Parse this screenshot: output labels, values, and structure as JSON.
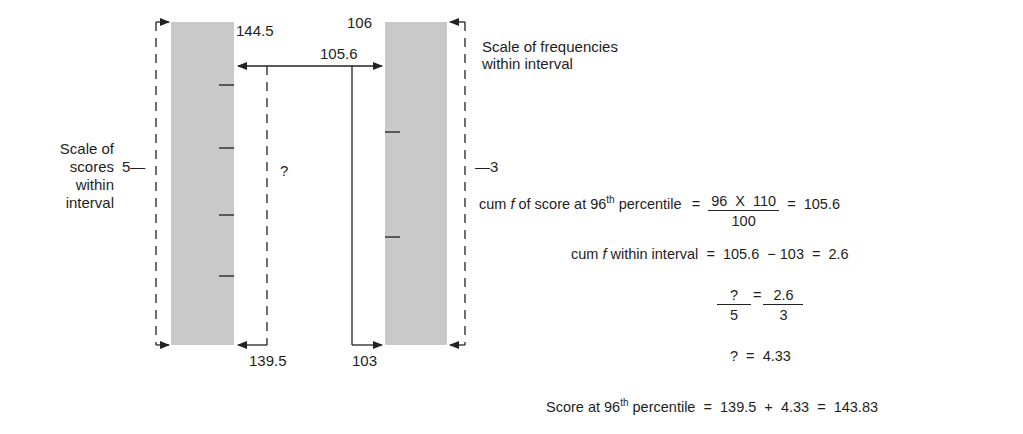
{
  "diagram": {
    "left_scale": {
      "label_lines": [
        "Scale of",
        "scores",
        "within",
        "interval"
      ],
      "span_value": "5",
      "top_value": "144.5",
      "bottom_value": "139.5",
      "unknown_span": "?"
    },
    "right_scale": {
      "label_lines": [
        "Scale of frequencies",
        "within interval"
      ],
      "span_value": "3",
      "top_value": "106",
      "bottom_value": "103",
      "target_value": "105.6"
    }
  },
  "equations": {
    "eq1": {
      "lhs_pre": "cum ",
      "lhs_f": "f",
      "lhs_mid": " of score at 96",
      "lhs_sup": "th",
      "lhs_post": " percentile",
      "equals": "=",
      "numerator": "96  X  110",
      "denominator": "100",
      "equals2": "=",
      "result": "105.6"
    },
    "eq2": {
      "lhs_pre": "cum ",
      "lhs_f": "f",
      "lhs_post": " within interval",
      "rhs": "=  105.6  − 103  =  2.6"
    },
    "eq3": {
      "num_left": "?",
      "den_left": "5",
      "equals": "=",
      "num_right": "2.6",
      "den_right": "3"
    },
    "eq4": {
      "text": "?  =  4.33"
    },
    "eq5": {
      "lhs_pre": "Score at 96",
      "lhs_sup": "th",
      "lhs_post": " percentile",
      "rhs": "=  139.5  +  4.33  =  143.83"
    }
  }
}
